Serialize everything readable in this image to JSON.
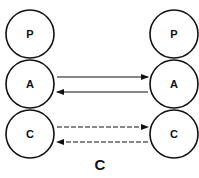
{
  "diagram": {
    "left_stack": [
      "P",
      "A",
      "C"
    ],
    "right_stack": [
      "P",
      "A",
      "C"
    ],
    "connections": [
      {
        "from": "A-left",
        "to": "A-right",
        "style": "solid"
      },
      {
        "from": "A-right",
        "to": "A-left",
        "style": "solid"
      },
      {
        "from": "C-left",
        "to": "C-right",
        "style": "dashed"
      },
      {
        "from": "C-right",
        "to": "C-left",
        "style": "dashed"
      }
    ],
    "caption": "C"
  }
}
